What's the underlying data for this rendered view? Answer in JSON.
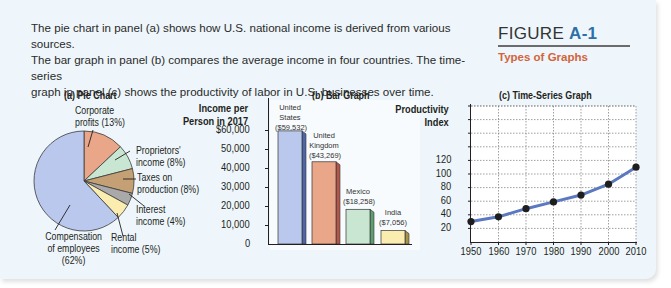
{
  "intro": {
    "line1": "The pie chart in panel (a) shows how U.S. national income is derived from various sources.",
    "line2": "The bar graph in panel (b) compares the average income in four countries. The time-series",
    "line3": "graph in panel (c) shows the productivity of labor in U.S. businesses over time."
  },
  "figure": {
    "label": "FIGURE",
    "number": "A-1",
    "subtitle": "Types of Graphs",
    "accent_color": "#2d6fa8",
    "subtitle_color": "#d2643c"
  },
  "chart_data": [
    {
      "type": "pie",
      "title": "(a) Pie Chart",
      "slices": [
        {
          "label": "Compensation of employees",
          "value": 62,
          "color": "#b9c8ec"
        },
        {
          "label": "Corporate profits",
          "value": 13,
          "color": "#e9a688"
        },
        {
          "label": "Proprietors' income",
          "value": 8,
          "color": "#c9e6d2"
        },
        {
          "label": "Taxes on production",
          "value": 8,
          "color": "#c5a074"
        },
        {
          "label": "Interest income",
          "value": 4,
          "color": "#a9a9a9"
        },
        {
          "label": "Rental income",
          "value": 5,
          "color": "#fbecb0"
        }
      ],
      "labels": {
        "corporate_1": "Corporate",
        "corporate_2": "profits (13%)",
        "proprietors_1": "Proprietors'",
        "proprietors_2": "income (8%)",
        "taxes_1": "Taxes on",
        "taxes_2": "production (8%)",
        "interest_1": "Interest",
        "interest_2": "income (4%)",
        "rental_1": "Rental",
        "rental_2": "income (5%)",
        "comp_1": "Compensation",
        "comp_2": "of employees",
        "comp_3": "(62%)"
      }
    },
    {
      "type": "bar",
      "title": "(b) Bar Graph",
      "ylabel_1": "Income per",
      "ylabel_2": "Person in 2017",
      "yticks": [
        "$60,000",
        "50,000",
        "40,000",
        "30,000",
        "20,000",
        "10,000",
        "0"
      ],
      "ylim": [
        0,
        60000
      ],
      "categories": [
        "United States",
        "United Kingdom",
        "Mexico",
        "India"
      ],
      "values": [
        59532,
        43269,
        18258,
        7056
      ],
      "value_labels": [
        "($59,532)",
        "($43,269)",
        "($18,258)",
        "($7,056)"
      ],
      "name_lines": [
        [
          "United",
          "States"
        ],
        [
          "United",
          "Kingdom"
        ],
        [
          "Mexico"
        ],
        [
          "India"
        ]
      ],
      "colors": [
        "#b9c8ec",
        "#e9a688",
        "#c9e6d2",
        "#fbecb0"
      ]
    },
    {
      "type": "line",
      "title": "(c) Time-Series Graph",
      "ylabel_1": "Productivity",
      "ylabel_2": "Index",
      "x": [
        1950,
        1960,
        1970,
        1980,
        1990,
        2000,
        2010
      ],
      "values": [
        30,
        37,
        49,
        59,
        69,
        85,
        110
      ],
      "yticks": [
        "120",
        "100",
        "80",
        "60",
        "40",
        "20"
      ],
      "xticks": [
        "1950",
        "1960",
        "1970",
        "1980",
        "1990",
        "2000",
        "2010"
      ],
      "line_color": "#5b78c0",
      "grid": true
    }
  ]
}
